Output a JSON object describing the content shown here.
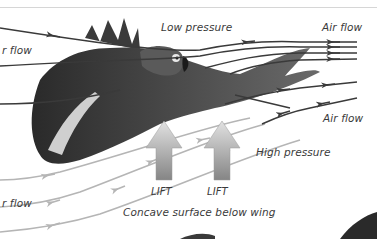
{
  "diagram": {
    "labels": {
      "low_pressure": "Low pressure",
      "air_flow_top_left": "r flow",
      "air_flow_top_right": "Air flow",
      "air_flow_mid_right": "Air flow",
      "high_pressure": "High pressure",
      "air_flow_bottom_left": "r flow",
      "lift_1": "LIFT",
      "lift_2": "LIFT",
      "concave_surface": "Concave surface below wing"
    },
    "colors": {
      "upper_airflow": "#3a3a3a",
      "lower_airflow": "#b5b5b5",
      "lift_arrow_top": "#d9d9d9",
      "lift_arrow_bottom": "#8a8a8a",
      "bird_body": "#2e2e2e",
      "bird_wing_panel": "#cfcfcf",
      "text": "#3a3a3a",
      "top_rule": "#d6d6d6"
    },
    "icons": {
      "lift_arrow": "up-arrow",
      "airflow_arrow": "left-arrow"
    }
  }
}
